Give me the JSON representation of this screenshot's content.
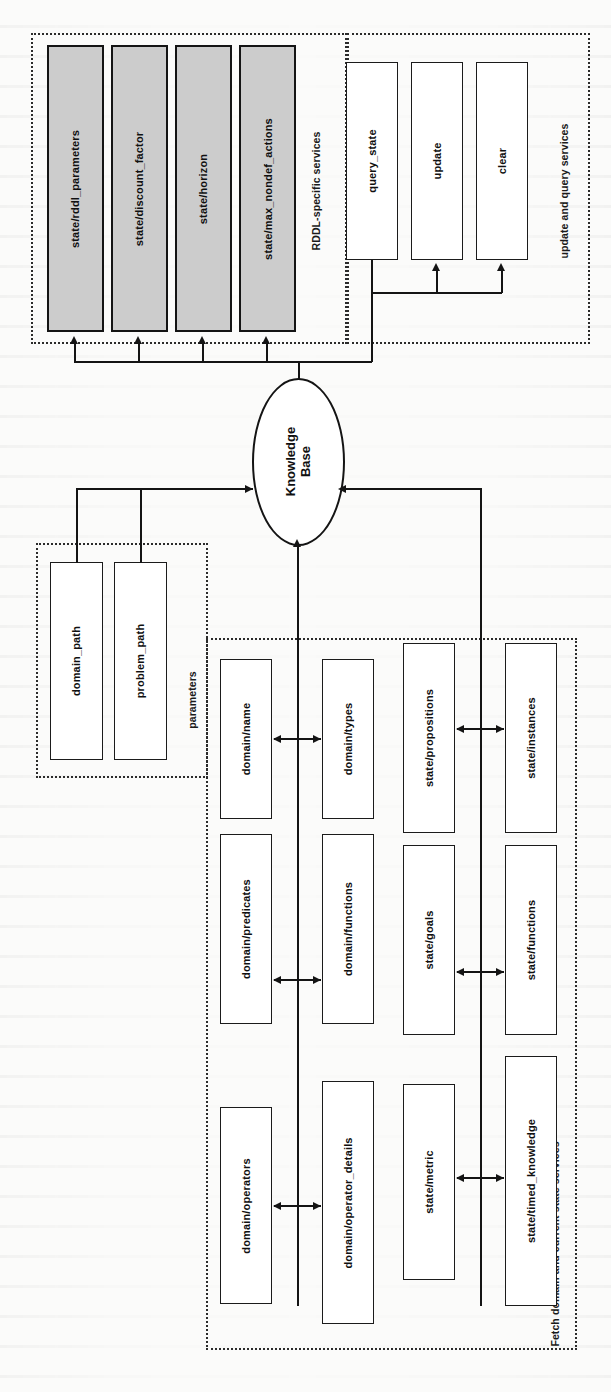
{
  "diagram": {
    "orientation": "rotated-90-ccw",
    "center_node": {
      "label_line1": "Knowledge",
      "label_line2": "Base"
    },
    "groups": [
      {
        "id": "rddl",
        "label": "RDDL-specific services",
        "boxes": [
          {
            "label": "state/rddl_parameters",
            "shaded": true
          },
          {
            "label": "state/discount_factor",
            "shaded": true
          },
          {
            "label": "state/horizon",
            "shaded": true
          },
          {
            "label": "state/max_nondef_actions",
            "shaded": true
          }
        ]
      },
      {
        "id": "updatequery",
        "label": "update and query services",
        "boxes": [
          {
            "label": "query_state",
            "shaded": false
          },
          {
            "label": "update",
            "shaded": false
          },
          {
            "label": "clear",
            "shaded": false
          }
        ]
      },
      {
        "id": "parameters",
        "label": "parameters",
        "boxes": [
          {
            "label": "domain_path",
            "shaded": false
          },
          {
            "label": "problem_path",
            "shaded": false
          }
        ]
      },
      {
        "id": "fetch",
        "label": "Fetch domain and current state services",
        "boxes": [
          {
            "label": "domain/name",
            "shaded": false
          },
          {
            "label": "domain/types",
            "shaded": false
          },
          {
            "label": "state/propositions",
            "shaded": false
          },
          {
            "label": "state/instances",
            "shaded": false
          },
          {
            "label": "domain/predicates",
            "shaded": false
          },
          {
            "label": "domain/functions",
            "shaded": false
          },
          {
            "label": "state/goals",
            "shaded": false
          },
          {
            "label": "state/functions",
            "shaded": false
          },
          {
            "label": "domain/operators",
            "shaded": false
          },
          {
            "label": "domain/operator_details",
            "shaded": false
          },
          {
            "label": "state/metric",
            "shaded": false
          },
          {
            "label": "state/timed_knowledge",
            "shaded": false
          }
        ]
      }
    ],
    "colors": {
      "stroke": "#141414",
      "shaded_fill": "#cccccc",
      "box_fill": "#ffffff",
      "page_bg": "#fbfbfa"
    }
  }
}
